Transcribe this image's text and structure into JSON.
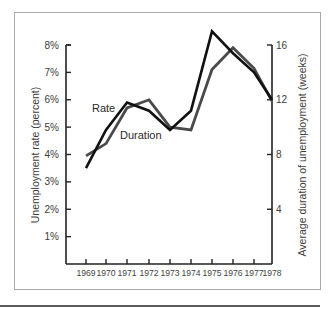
{
  "chart_data": {
    "type": "line",
    "title": "",
    "xlabel": "",
    "ylabel": "Unemployment rate (percent)",
    "y2label": "Average duration of unemployment (weeks)",
    "categories": [
      "1969",
      "1970",
      "1971",
      "1972",
      "1973",
      "1974",
      "1975",
      "1976",
      "1977",
      "1978"
    ],
    "series": [
      {
        "name": "Rate",
        "axis": "left",
        "unit": "percent",
        "color": "#111111",
        "values": [
          3.5,
          4.9,
          5.9,
          5.6,
          4.9,
          5.6,
          8.5,
          7.7,
          7.0,
          6.0
        ]
      },
      {
        "name": "Duration",
        "axis": "right",
        "unit": "weeks",
        "color": "#4a4a4a",
        "values": [
          7.9,
          8.8,
          11.4,
          12.0,
          10.0,
          9.8,
          14.2,
          15.8,
          14.3,
          11.9
        ]
      }
    ],
    "ylim": [
      0,
      8
    ],
    "y2lim": [
      0,
      16
    ],
    "yticks": [
      "1%",
      "2%",
      "3%",
      "4%",
      "5%",
      "6%",
      "7%",
      "8%"
    ],
    "y2ticks": [
      "4",
      "8",
      "12",
      "16"
    ],
    "grid": false,
    "legend": "inline labels"
  },
  "labels": {
    "rate": "Rate",
    "duration": "Duration",
    "left_axis_title": "Unemployment rate (percent)",
    "right_axis_title": "Average duration of unemployment (weeks)"
  }
}
